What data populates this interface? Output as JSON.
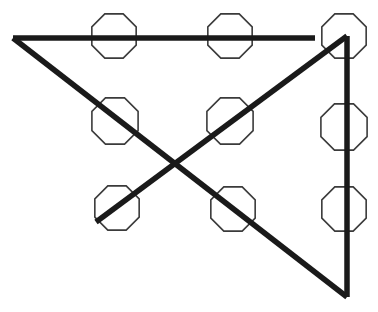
{
  "figure": {
    "canvas": {
      "width": 378,
      "height": 312,
      "background_color": "#ffffff"
    },
    "octagons": {
      "outline_color": "#3b3b3b",
      "fill_color": "none",
      "stroke_width": 1.6,
      "count": 9,
      "grid_rows": 3,
      "grid_columns": 3,
      "items": [
        {
          "id": "octagon-r1c1",
          "row": 1,
          "column": 1,
          "cx": 114,
          "cy": 36,
          "radius": 24
        },
        {
          "id": "octagon-r1c2",
          "row": 1,
          "column": 2,
          "cx": 230,
          "cy": 36,
          "radius": 24
        },
        {
          "id": "octagon-r1c3",
          "row": 1,
          "column": 3,
          "cx": 344,
          "cy": 36,
          "radius": 24
        },
        {
          "id": "octagon-r2c1",
          "row": 2,
          "column": 1,
          "cx": 115,
          "cy": 121,
          "radius": 25
        },
        {
          "id": "octagon-r2c2",
          "row": 2,
          "column": 2,
          "cx": 230,
          "cy": 121,
          "radius": 25
        },
        {
          "id": "octagon-r2c3",
          "row": 2,
          "column": 3,
          "cx": 344,
          "cy": 127,
          "radius": 25
        },
        {
          "id": "octagon-r3c1",
          "row": 3,
          "column": 1,
          "cx": 117,
          "cy": 208,
          "radius": 24
        },
        {
          "id": "octagon-r3c2",
          "row": 3,
          "column": 2,
          "cx": 233,
          "cy": 209,
          "radius": 24
        },
        {
          "id": "octagon-r3c3",
          "row": 3,
          "column": 3,
          "cx": 344,
          "cy": 209,
          "radius": 24
        }
      ]
    },
    "strokes": {
      "color": "#1a1a1a",
      "stroke_width": 5.5,
      "segments": [
        {
          "id": "horizontal-top-line",
          "label": "top horizontal line",
          "x1": 13,
          "y1": 38,
          "x2": 315,
          "y2": 38
        },
        {
          "id": "descending-diagonal",
          "label": "long diagonal from top-left vertex to bottom-right vertex",
          "x1": 13,
          "y1": 38,
          "x2": 347,
          "y2": 297
        },
        {
          "id": "ascending-diagonal",
          "label": "diagonal from lower-left octagon up to top-right apex",
          "x1": 96,
          "y1": 222,
          "x2": 347,
          "y2": 36
        },
        {
          "id": "vertical-right-line",
          "label": "right vertical line",
          "x1": 347,
          "y1": 36,
          "x2": 347,
          "y2": 297
        }
      ]
    },
    "vertices": [
      {
        "id": "vertex-left",
        "x": 13,
        "y": 38
      },
      {
        "id": "vertex-top-right",
        "x": 347,
        "y": 36
      },
      {
        "id": "vertex-bottom-right",
        "x": 347,
        "y": 297
      },
      {
        "id": "vertex-lower-left-diagonal-start",
        "x": 96,
        "y": 222
      },
      {
        "id": "crossing-point",
        "x": 170,
        "y": 163
      }
    ]
  }
}
